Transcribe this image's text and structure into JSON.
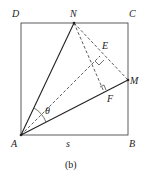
{
  "figure": {
    "caption": "(b)",
    "vertices": {
      "A": "A",
      "B": "B",
      "C": "C",
      "D": "D",
      "N": "N",
      "M": "M",
      "E": "E",
      "F": "F"
    },
    "side_label": "s",
    "angle_label": "θ"
  }
}
